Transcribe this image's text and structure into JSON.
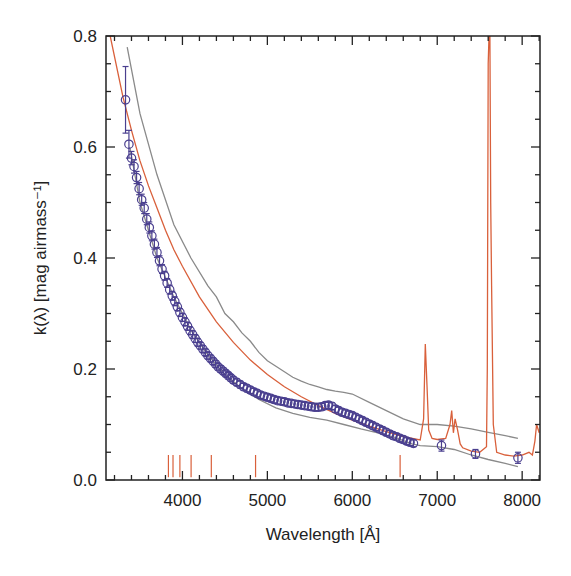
{
  "chart_data": {
    "type": "line",
    "title": "",
    "xlabel": "Wavelength [Å]",
    "ylabel": "k(λ) [mag airmass⁻¹]",
    "xlim": [
      3100,
      8210
    ],
    "ylim": [
      0.0,
      0.8
    ],
    "x_ticks": [
      4000,
      5000,
      6000,
      7000,
      8000
    ],
    "x_tick_labels": [
      "4000",
      "5000",
      "6000",
      "7000",
      "8000"
    ],
    "y_ticks": [
      0.0,
      0.2,
      0.4,
      0.6,
      0.8
    ],
    "y_tick_labels": [
      "0.0",
      "0.2",
      "0.4",
      "0.6",
      "0.8"
    ],
    "grid": false,
    "legend": null,
    "colors": {
      "measured": "#4a3f8f",
      "model": "#d9603b",
      "envelope": "#8a8a8a",
      "markers": "#d9603b",
      "axis": "#222222"
    },
    "series": [
      {
        "name": "measured extinction (points with error bars)",
        "style": "circles+errorbars",
        "x": [
          3330,
          3370,
          3400,
          3430,
          3460,
          3490,
          3520,
          3550,
          3580,
          3610,
          3640,
          3670,
          3700,
          3730,
          3760,
          3790,
          3820,
          3850,
          3880,
          3910,
          3940,
          3970,
          4000,
          4030,
          4060,
          4090,
          4120,
          4150,
          4180,
          4210,
          4240,
          4270,
          4300,
          4330,
          4360,
          4390,
          4420,
          4450,
          4480,
          4510,
          4540,
          4570,
          4600,
          4640,
          4680,
          4720,
          4760,
          4800,
          4840,
          4880,
          4920,
          4960,
          5000,
          5040,
          5080,
          5120,
          5160,
          5200,
          5240,
          5280,
          5320,
          5360,
          5400,
          5440,
          5480,
          5520,
          5560,
          5600,
          5640,
          5680,
          5720,
          5760,
          5800,
          5840,
          5880,
          5920,
          5960,
          6000,
          6040,
          6080,
          6120,
          6160,
          6200,
          6240,
          6280,
          6320,
          6360,
          6400,
          6440,
          6480,
          6520,
          6560,
          6600,
          6640,
          6680,
          6720,
          7050,
          7450,
          7950
        ],
        "y": [
          0.685,
          0.605,
          0.58,
          0.565,
          0.545,
          0.525,
          0.505,
          0.49,
          0.47,
          0.455,
          0.44,
          0.425,
          0.41,
          0.395,
          0.38,
          0.368,
          0.355,
          0.343,
          0.332,
          0.322,
          0.312,
          0.302,
          0.293,
          0.285,
          0.277,
          0.269,
          0.262,
          0.255,
          0.248,
          0.242,
          0.236,
          0.23,
          0.224,
          0.219,
          0.214,
          0.209,
          0.204,
          0.2,
          0.196,
          0.192,
          0.188,
          0.184,
          0.18,
          0.176,
          0.172,
          0.168,
          0.165,
          0.162,
          0.159,
          0.156,
          0.153,
          0.151,
          0.149,
          0.147,
          0.145,
          0.143,
          0.142,
          0.141,
          0.139,
          0.138,
          0.137,
          0.136,
          0.135,
          0.134,
          0.133,
          0.132,
          0.131,
          0.131,
          0.132,
          0.134,
          0.135,
          0.133,
          0.128,
          0.125,
          0.122,
          0.12,
          0.118,
          0.116,
          0.113,
          0.11,
          0.107,
          0.104,
          0.101,
          0.098,
          0.095,
          0.092,
          0.089,
          0.086,
          0.083,
          0.08,
          0.078,
          0.075,
          0.073,
          0.07,
          0.068,
          0.066,
          0.062,
          0.047,
          0.04
        ],
        "yerr": [
          0.06,
          0.025,
          0.012,
          0.012,
          0.011,
          0.011,
          0.01,
          0.01,
          0.01,
          0.01,
          0.009,
          0.009,
          0.009,
          0.009,
          0.008,
          0.008,
          0.008,
          0.008,
          0.008,
          0.008,
          0.007,
          0.007,
          0.007,
          0.007,
          0.007,
          0.007,
          0.007,
          0.007,
          0.007,
          0.006,
          0.006,
          0.006,
          0.006,
          0.006,
          0.006,
          0.006,
          0.006,
          0.006,
          0.006,
          0.006,
          0.006,
          0.006,
          0.006,
          0.006,
          0.006,
          0.006,
          0.006,
          0.006,
          0.006,
          0.006,
          0.006,
          0.006,
          0.006,
          0.006,
          0.006,
          0.006,
          0.006,
          0.006,
          0.006,
          0.006,
          0.006,
          0.006,
          0.006,
          0.006,
          0.006,
          0.006,
          0.006,
          0.006,
          0.006,
          0.006,
          0.006,
          0.006,
          0.006,
          0.006,
          0.006,
          0.006,
          0.006,
          0.006,
          0.006,
          0.006,
          0.006,
          0.006,
          0.006,
          0.006,
          0.006,
          0.006,
          0.006,
          0.006,
          0.006,
          0.006,
          0.006,
          0.006,
          0.006,
          0.006,
          0.006,
          0.006,
          0.01,
          0.008,
          0.01
        ]
      },
      {
        "name": "model extinction (red line)",
        "style": "line",
        "x": [
          3150,
          3300,
          3400,
          3500,
          3600,
          3700,
          3800,
          3900,
          4000,
          4200,
          4400,
          4600,
          4800,
          5000,
          5200,
          5400,
          5600,
          5800,
          6000,
          6200,
          6400,
          6600,
          6800,
          6840,
          6860,
          6880,
          6900,
          6940,
          7000,
          7100,
          7150,
          7170,
          7190,
          7210,
          7240,
          7270,
          7300,
          7400,
          7500,
          7580,
          7590,
          7600,
          7610,
          7620,
          7630,
          7640,
          7660,
          7700,
          7800,
          7900,
          8000,
          8080,
          8120,
          8150,
          8170,
          8200
        ],
        "y": [
          0.8,
          0.69,
          0.63,
          0.575,
          0.53,
          0.49,
          0.45,
          0.415,
          0.385,
          0.33,
          0.285,
          0.248,
          0.216,
          0.19,
          0.168,
          0.15,
          0.134,
          0.12,
          0.108,
          0.097,
          0.087,
          0.078,
          0.072,
          0.11,
          0.245,
          0.17,
          0.09,
          0.075,
          0.073,
          0.075,
          0.1,
          0.125,
          0.085,
          0.11,
          0.09,
          0.065,
          0.058,
          0.052,
          0.05,
          0.06,
          0.2,
          0.75,
          0.8,
          0.8,
          0.5,
          0.35,
          0.1,
          0.05,
          0.045,
          0.043,
          0.045,
          0.05,
          0.045,
          0.07,
          0.1,
          0.085
        ]
      },
      {
        "name": "upper envelope (gray)",
        "style": "line",
        "x": [
          3350,
          3500,
          3700,
          3900,
          4100,
          4300,
          4400,
          4500,
          4600,
          4700,
          4800,
          4900,
          5000,
          5100,
          5200,
          5300,
          5400,
          5500,
          5600,
          5700,
          5800,
          5900,
          6000,
          6200,
          6400,
          6600,
          6800,
          7000,
          7200,
          7400,
          7600,
          7800,
          7950
        ],
        "y": [
          0.78,
          0.66,
          0.55,
          0.46,
          0.4,
          0.35,
          0.33,
          0.3,
          0.285,
          0.265,
          0.25,
          0.23,
          0.215,
          0.205,
          0.195,
          0.185,
          0.178,
          0.172,
          0.168,
          0.163,
          0.16,
          0.158,
          0.155,
          0.14,
          0.125,
          0.11,
          0.1,
          0.1,
          0.097,
          0.092,
          0.086,
          0.08,
          0.075
        ]
      },
      {
        "name": "lower envelope (gray)",
        "style": "line",
        "x": [
          3380,
          3500,
          3700,
          3900,
          4100,
          4300,
          4500,
          4700,
          4900,
          5100,
          5300,
          5500,
          5700,
          5900,
          6100,
          6300,
          6500,
          6700,
          6800,
          7000,
          7200,
          7400,
          7600,
          7800,
          7950
        ],
        "y": [
          0.6,
          0.5,
          0.4,
          0.33,
          0.27,
          0.225,
          0.19,
          0.165,
          0.145,
          0.13,
          0.12,
          0.113,
          0.108,
          0.1,
          0.092,
          0.085,
          0.077,
          0.065,
          0.062,
          0.06,
          0.055,
          0.045,
          0.037,
          0.03,
          0.024
        ]
      }
    ],
    "annotations": {
      "line_markers": {
        "description": "short vertical red ticks near the x-axis marking spectral line positions",
        "x": [
          3835,
          3889,
          3970,
          4102,
          4340,
          4861,
          6563
        ],
        "y_range": [
          0.005,
          0.045
        ]
      }
    }
  }
}
